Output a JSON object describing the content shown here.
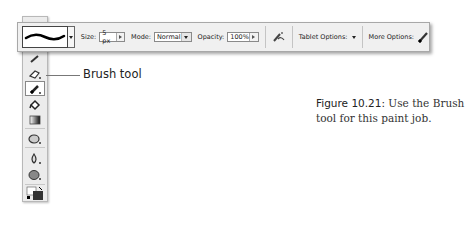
{
  "options_bar": {
    "brush_preset_icon": "brush-stroke-preview",
    "size_label": "Size:",
    "size_value": "5 px",
    "mode_label": "Mode:",
    "mode_value": "Normal",
    "opacity_label": "Opacity:",
    "opacity_value": "100%",
    "airbrush_icon": "airbrush-icon",
    "tablet_options_label": "Tablet Options:",
    "more_options_label": "More Options:",
    "more_options_icon": "brush-icon"
  },
  "toolbox": {
    "tools": [
      {
        "name": "pencil-tool",
        "selected": false
      },
      {
        "name": "eraser-tool",
        "selected": false
      },
      {
        "name": "brush-tool",
        "selected": true
      },
      {
        "name": "paint-bucket-tool",
        "selected": false
      },
      {
        "name": "gradient-tool",
        "selected": false
      },
      {
        "name": "smudge-tool",
        "selected": false
      },
      {
        "name": "blur-tool",
        "selected": false
      },
      {
        "name": "dodge-tool",
        "selected": false
      },
      {
        "name": "color-swatches",
        "selected": false
      }
    ]
  },
  "callout": {
    "label": "Brush tool"
  },
  "caption": {
    "figure_label": "Figure 10.21:",
    "text": " Use the Brush tool for this paint job."
  }
}
